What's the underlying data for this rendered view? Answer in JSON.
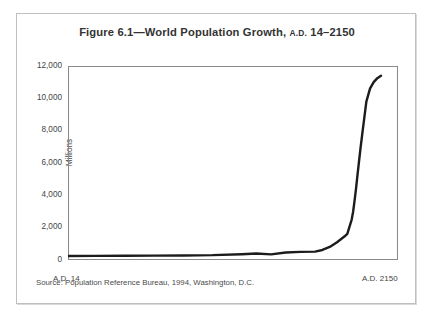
{
  "figure": {
    "title_main": "Figure 6.1—World Population Growth,",
    "title_era": "A.D.",
    "title_range": "14–2150",
    "source_note": "Source: Population Reference Bureau, 1994, Washington, D.C.",
    "border_color": "#bfbfbf",
    "background_color": "#ffffff"
  },
  "chart_data": {
    "type": "line",
    "title": "Figure 6.1—World Population Growth, A.D. 14–2150",
    "xlabel": "",
    "ylabel": "Millions",
    "ylim": [
      0,
      12000
    ],
    "xlim": [
      14,
      2150
    ],
    "grid": false,
    "legend": null,
    "line_color": "#1c1c1c",
    "axis_color": "#808080",
    "y_ticks": [
      0,
      2000,
      4000,
      6000,
      8000,
      10000,
      12000
    ],
    "y_tick_labels": [
      "0",
      "2,000",
      "4,000",
      "6,000",
      "8,000",
      "10,000",
      "12,000"
    ],
    "x_ticks": [
      14,
      2150
    ],
    "x_tick_labels": [
      "A.D. 14",
      "A.D. 2150"
    ],
    "series": [
      {
        "name": "World population",
        "x": [
          14,
          200,
          400,
          600,
          800,
          1000,
          1200,
          1300,
          1400,
          1500,
          1600,
          1700,
          1750,
          1800,
          1850,
          1900,
          1920,
          1950,
          1960,
          1970,
          1980,
          1990,
          2000,
          2010,
          2025,
          2050,
          2075,
          2100,
          2125,
          2150
        ],
        "values": [
          250,
          255,
          260,
          270,
          280,
          300,
          360,
          400,
          350,
          460,
          500,
          520,
          620,
          810,
          1100,
          1450,
          1620,
          2500,
          3000,
          3700,
          4450,
          5300,
          6100,
          6900,
          8000,
          9800,
          10600,
          11000,
          11250,
          11400
        ]
      }
    ]
  }
}
